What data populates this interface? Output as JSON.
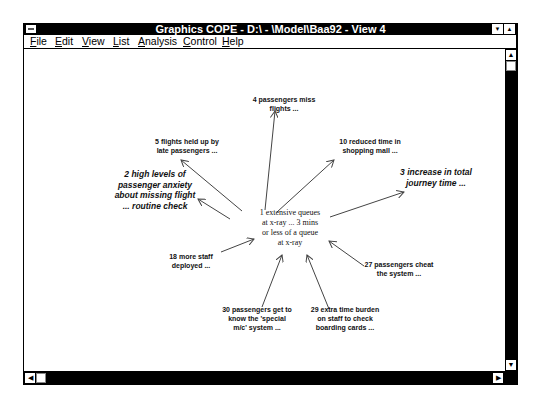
{
  "window": {
    "title": "Graphics COPE - D:\\ - \\Model\\Baa92 - View 4",
    "system_menu_icon": "system-menu-icon",
    "minimize_glyph": "▼",
    "maximize_glyph": "▲"
  },
  "menubar": {
    "items": [
      {
        "accel": "F",
        "rest": "ile",
        "x": 6
      },
      {
        "accel": "E",
        "rest": "dit",
        "x": 31
      },
      {
        "accel": "V",
        "rest": "iew",
        "x": 58
      },
      {
        "accel": "L",
        "rest": "ist",
        "x": 89
      },
      {
        "accel": "A",
        "rest": "nalysis",
        "x": 114
      },
      {
        "accel": "C",
        "rest": "ontrol",
        "x": 159
      },
      {
        "accel": "H",
        "rest": "elp",
        "x": 198
      }
    ]
  },
  "scrollbars": {
    "up_glyph": "▲",
    "down_glyph": "▼",
    "left_glyph": "◀",
    "right_glyph": "▶"
  },
  "diagram": {
    "arrow_color": "#444444",
    "central": {
      "id": 1,
      "lines": [
        "1 extensive queues",
        "at x-ray ... 3 mins",
        "or less of a queue",
        "at x-ray"
      ]
    },
    "nodes": [
      {
        "id": 4,
        "style": "bold",
        "lines": [
          "4 passengers miss",
          "flights ..."
        ]
      },
      {
        "id": 5,
        "style": "bold",
        "lines": [
          "5 flights held up by",
          "late passengers ..."
        ]
      },
      {
        "id": 10,
        "style": "bold",
        "lines": [
          "10 reduced time in",
          "shopping mall ..."
        ]
      },
      {
        "id": 2,
        "style": "italic",
        "lines": [
          "2 high levels of",
          "passenger anxiety",
          "about missing flight",
          "... routine check"
        ]
      },
      {
        "id": 3,
        "style": "italic",
        "lines": [
          "3 increase in total",
          "journey time ..."
        ]
      },
      {
        "id": 18,
        "style": "bold",
        "lines": [
          "18 more staff",
          "deployed ..."
        ]
      },
      {
        "id": 27,
        "style": "bold",
        "lines": [
          "27 passengers cheat",
          "the system ..."
        ]
      },
      {
        "id": 30,
        "style": "bold",
        "lines": [
          "30 passengers get to",
          "know the 'special",
          "m/c' system ..."
        ]
      },
      {
        "id": 29,
        "style": "bold",
        "lines": [
          "29 extra time burden",
          "on staff to check",
          "boarding cards ..."
        ]
      }
    ]
  }
}
